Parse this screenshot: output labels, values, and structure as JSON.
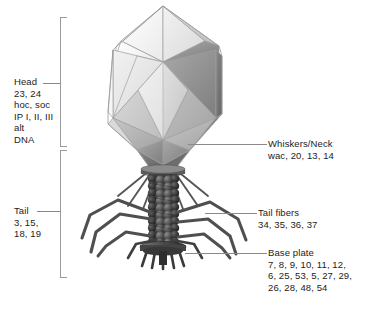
{
  "diagram": {
    "background_color": "#ffffff",
    "text_color": "#1c1c1c",
    "leader_color": "#8a8a8a",
    "bracket_color": "#9a9a9a"
  },
  "labels": {
    "head": {
      "name": "Head",
      "text": "Head\n23, 24\nhoc, soc\nIP I, II, III\nalt\nDNA",
      "genes": [
        "23",
        "24",
        "hoc",
        "soc",
        "IP I, II, III",
        "alt",
        "DNA"
      ]
    },
    "tail": {
      "name": "Tail",
      "text": "Tail\n3, 15,\n18, 19",
      "genes": [
        "3",
        "15",
        "18",
        "19"
      ]
    },
    "whiskers_neck": {
      "name": "Whiskers/Neck",
      "text": "Whiskers/Neck\nwac, 20, 13, 14",
      "genes": [
        "wac",
        "20",
        "13",
        "14"
      ]
    },
    "tail_fibers": {
      "name": "Tail fibers",
      "text": "Tail fibers\n34, 35, 36, 37",
      "genes": [
        "34",
        "35",
        "36",
        "37"
      ]
    },
    "base_plate": {
      "name": "Base plate",
      "text": "Base plate\n7, 8, 9, 10, 11, 12,\n6, 25, 53, 5, 27, 29,\n26, 28, 48, 54",
      "genes": [
        "7",
        "8",
        "9",
        "10",
        "11",
        "12",
        "6",
        "25",
        "53",
        "5",
        "27",
        "29",
        "26",
        "28",
        "48",
        "54"
      ]
    }
  },
  "figure": {
    "capsid": {
      "shape": "prolate-icosahedron",
      "facet_colors": [
        "#fbfbfb",
        "#f0f0f0",
        "#e2e2e2",
        "#d4d4d4",
        "#c2c2c2",
        "#b0b0b0",
        "#9a9a9a",
        "#888888",
        "#757575",
        "#666666"
      ],
      "edge_color": "#9b9b9b"
    },
    "neck": {
      "collar_color": "#6f6f6f",
      "whisker_color": "#5a5a5a",
      "whisker_count": 8
    },
    "sheath": {
      "color_dark": "#3a3a3a",
      "color_light": "#6e6e6e",
      "rings": 13,
      "beads_per_ring": 5
    },
    "base_plate": {
      "color": "#4a4a4a"
    },
    "tail_fibers": {
      "color": "#555555",
      "count": 6
    },
    "tail_pins": {
      "color": "#454545",
      "count": 5
    }
  }
}
